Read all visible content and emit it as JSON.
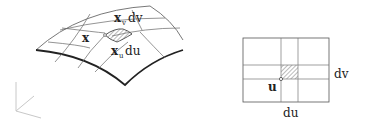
{
  "surface_panel": {
    "labels": {
      "x": "x",
      "xv_base": "x",
      "xv_sub": "v",
      "xv_suffix": "dv",
      "xu_base": "x",
      "xu_sub": "u",
      "xu_suffix": "du"
    },
    "hatch_color": "#888888"
  },
  "parameter_panel": {
    "labels": {
      "u": "u",
      "du": "du",
      "dv": "dv"
    }
  },
  "colors": {
    "line": "#333333",
    "light_line": "#999999",
    "axis": "#c8c8c8"
  }
}
